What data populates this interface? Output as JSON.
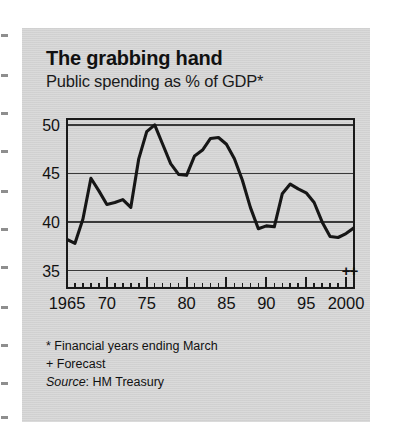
{
  "header": {
    "title": "The grabbing hand",
    "subtitle": "Public spending as % of GDP*"
  },
  "footnotes": {
    "star": "* Financial years ending March",
    "plus": "+ Forecast",
    "source_label": "Source",
    "source_sep": ": ",
    "source_value": "HM Treasury"
  },
  "colors": {
    "panel": "#d8d8d8",
    "ink": "#111111",
    "line": "#161616",
    "grid": "#3a3a3a",
    "frame": "#1a1a1a"
  },
  "chart_data": {
    "type": "line",
    "title": "The grabbing hand",
    "subtitle": "Public spending as % of GDP*",
    "xlabel": "",
    "ylabel": "",
    "xlim": [
      1965,
      2001
    ],
    "ylim": [
      33.2,
      50.6
    ],
    "yticks": [
      35,
      40,
      45,
      50
    ],
    "ytick_labels": [
      "35",
      "40",
      "45",
      "50"
    ],
    "xticks": [
      1965,
      1970,
      1975,
      1980,
      1985,
      1990,
      1995,
      2000
    ],
    "xtick_labels": [
      "1965",
      "70",
      "75",
      "80",
      "85",
      "90",
      "95",
      "2000"
    ],
    "minor_xticks_every": 1,
    "grid": "horizontal",
    "legend": "none",
    "series": [
      {
        "name": "Public spending as % of GDP",
        "x": [
          1965,
          1966,
          1967,
          1968,
          1969,
          1970,
          1971,
          1972,
          1973,
          1974,
          1975,
          1976,
          1977,
          1978,
          1979,
          1980,
          1981,
          1982,
          1983,
          1984,
          1985,
          1986,
          1987,
          1988,
          1989,
          1990,
          1991,
          1992,
          1993,
          1994,
          1995,
          1996,
          1997,
          1998,
          1999,
          2000,
          2001
        ],
        "values": [
          38.2,
          37.8,
          40.3,
          44.5,
          43.2,
          41.8,
          42.0,
          42.3,
          41.5,
          46.5,
          49.3,
          50.0,
          48.0,
          46.0,
          44.9,
          44.8,
          46.8,
          47.4,
          48.6,
          48.7,
          48.0,
          46.5,
          44.3,
          41.5,
          39.3,
          39.6,
          39.5,
          42.9,
          43.9,
          43.4,
          43.0,
          42.0,
          40.0,
          38.5,
          38.4,
          38.8,
          39.4
        ]
      }
    ],
    "forecast_markers": {
      "symbol": "+",
      "count": 2,
      "years": [
        2000,
        2001
      ],
      "note": "+ Forecast"
    },
    "source": "HM Treasury"
  }
}
